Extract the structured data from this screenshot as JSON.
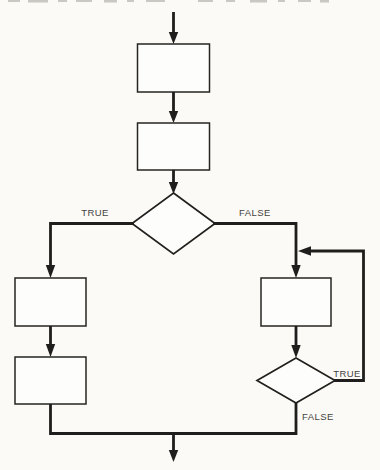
{
  "diagram": {
    "type": "flowchart",
    "colors": {
      "line": "#1f1e1c",
      "label": "#44423f",
      "background": "#fbfaf7",
      "node_fill": "#fdfdfb"
    },
    "nodes": [
      {
        "id": "process-1",
        "type": "process",
        "label": ""
      },
      {
        "id": "process-2",
        "type": "process",
        "label": ""
      },
      {
        "id": "decision-1",
        "type": "decision",
        "label": ""
      },
      {
        "id": "process-3",
        "type": "process",
        "label": ""
      },
      {
        "id": "process-4",
        "type": "process",
        "label": ""
      },
      {
        "id": "process-5",
        "type": "process",
        "label": ""
      },
      {
        "id": "decision-2",
        "type": "decision",
        "label": ""
      }
    ],
    "edges": [
      {
        "from": "entry",
        "to": "process-1",
        "label": ""
      },
      {
        "from": "process-1",
        "to": "process-2",
        "label": ""
      },
      {
        "from": "process-2",
        "to": "decision-1",
        "label": ""
      },
      {
        "from": "decision-1",
        "to": "process-3",
        "label": "TRUE"
      },
      {
        "from": "decision-1",
        "to": "process-5",
        "label": "FALSE"
      },
      {
        "from": "process-3",
        "to": "process-4",
        "label": ""
      },
      {
        "from": "process-4",
        "to": "merge",
        "label": ""
      },
      {
        "from": "process-5",
        "to": "decision-2",
        "label": ""
      },
      {
        "from": "decision-2",
        "to": "process-5",
        "label": "TRUE"
      },
      {
        "from": "decision-2",
        "to": "merge",
        "label": "FALSE"
      },
      {
        "from": "merge",
        "to": "exit",
        "label": ""
      }
    ]
  }
}
